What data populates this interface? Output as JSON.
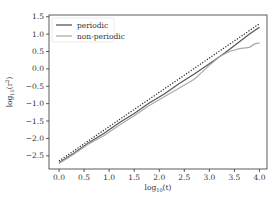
{
  "chart_data": {
    "type": "line",
    "title": "",
    "xlabel": "log10(t)",
    "ylabel": "log10(r^2)",
    "xlim": [
      -0.2,
      4.15
    ],
    "ylim": [
      -2.88,
      1.55
    ],
    "xticks": [
      0.0,
      0.5,
      1.0,
      1.5,
      2.0,
      2.5,
      3.0,
      3.5,
      4.0
    ],
    "xtick_labels": [
      "0.0",
      "0.5",
      "1.0",
      "1.5",
      "2.0",
      "2.5",
      "3.0",
      "3.5",
      "4.0"
    ],
    "yticks": [
      -2.5,
      -2.0,
      -1.5,
      -1.0,
      -0.5,
      0.0,
      0.5,
      1.0,
      1.5
    ],
    "ytick_labels": [
      "−2.5",
      "−2.0",
      "−1.5",
      "−1.0",
      "−0.5",
      "0.0",
      "0.5",
      "1.0",
      "1.5"
    ],
    "grid": false,
    "legend_position": "upper left",
    "series": [
      {
        "name": "periodic",
        "color": "#555555",
        "style": "solid",
        "x": [
          0.0,
          0.3,
          0.6,
          0.9,
          1.2,
          1.5,
          1.8,
          2.1,
          2.4,
          2.7,
          3.0,
          3.3,
          3.6,
          3.8,
          4.0
        ],
        "y": [
          -2.7,
          -2.42,
          -2.12,
          -1.85,
          -1.55,
          -1.28,
          -0.98,
          -0.72,
          -0.42,
          -0.15,
          0.15,
          0.45,
          0.78,
          1.0,
          1.2
        ]
      },
      {
        "name": "non-periodic",
        "color": "#aaaaaa",
        "style": "solid",
        "x": [
          0.0,
          0.3,
          0.6,
          0.9,
          1.2,
          1.5,
          1.8,
          2.1,
          2.4,
          2.7,
          3.0,
          3.2,
          3.4,
          3.6,
          3.8,
          3.9,
          4.0
        ],
        "y": [
          -2.72,
          -2.45,
          -2.15,
          -1.92,
          -1.62,
          -1.35,
          -1.05,
          -0.8,
          -0.55,
          -0.3,
          0.1,
          0.35,
          0.5,
          0.58,
          0.62,
          0.72,
          0.75
        ]
      },
      {
        "name": "reference (dotted)",
        "color": "#222222",
        "style": "dotted",
        "x": [
          0.0,
          4.0
        ],
        "y": [
          -2.65,
          1.3
        ]
      }
    ]
  },
  "legend": {
    "items": [
      {
        "label": "periodic",
        "color": "#555555"
      },
      {
        "label": "non-periodic",
        "color": "#aaaaaa"
      }
    ]
  },
  "axes": {
    "xlabel_main": "log",
    "xlabel_sub": "10",
    "xlabel_arg": "(t)",
    "ylabel_main": "log",
    "ylabel_sub": "10",
    "ylabel_arg": "(r",
    "ylabel_sup": "2",
    "ylabel_close": ")"
  }
}
